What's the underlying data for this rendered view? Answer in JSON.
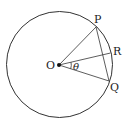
{
  "diagram": {
    "type": "geometry-circle",
    "background": "#ffffff",
    "stroke": "#333333",
    "circle": {
      "center": "O",
      "cx": 59.5,
      "cy": 64.5,
      "r": 53
    },
    "points": {
      "O": {
        "label": "O",
        "x": 59,
        "y": 65
      },
      "P": {
        "label": "P",
        "x": 96,
        "y": 27
      },
      "R": {
        "label": "R",
        "x": 110.5,
        "y": 53
      },
      "Q": {
        "label": "Q",
        "x": 109,
        "y": 81
      }
    },
    "segments": [
      [
        "O",
        "P"
      ],
      [
        "O",
        "R"
      ],
      [
        "O",
        "Q"
      ],
      [
        "P",
        "Q"
      ]
    ],
    "angle": {
      "label": "θ",
      "between": [
        "R",
        "Q"
      ],
      "vertex": "O"
    }
  }
}
